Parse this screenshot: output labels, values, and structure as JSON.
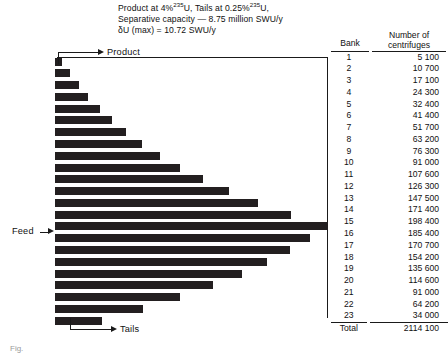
{
  "header": {
    "line1_a": "Product at 4%",
    "line1_sup1": "235",
    "line1_b": "U, Tails at 0.25%",
    "line1_sup2": "235",
    "line1_c": "U,",
    "line2": "Separative capacity — 8.75 million SWU/y",
    "line3": "δU (max)  =  10.72 SWU/y"
  },
  "callouts": {
    "product": "Product",
    "feed": "Feed",
    "tails": "Tails"
  },
  "table": {
    "col_bank": "Bank",
    "col_count_line1": "Number of",
    "col_count_line2": "centrifuges",
    "total_label": "Total",
    "total_value": "2114 100",
    "rows": [
      {
        "bank": "1",
        "count": "5 100"
      },
      {
        "bank": "2",
        "count": "10 700"
      },
      {
        "bank": "3",
        "count": "17 100"
      },
      {
        "bank": "4",
        "count": "24 300"
      },
      {
        "bank": "5",
        "count": "32 400"
      },
      {
        "bank": "6",
        "count": "41 400"
      },
      {
        "bank": "7",
        "count": "51 700"
      },
      {
        "bank": "8",
        "count": "63 200"
      },
      {
        "bank": "9",
        "count": "76 300"
      },
      {
        "bank": "10",
        "count": "91 000"
      },
      {
        "bank": "11",
        "count": "107 600"
      },
      {
        "bank": "12",
        "count": "126 300"
      },
      {
        "bank": "13",
        "count": "147 500"
      },
      {
        "bank": "14",
        "count": "171 400"
      },
      {
        "bank": "15",
        "count": "198 400"
      },
      {
        "bank": "16",
        "count": "185 400"
      },
      {
        "bank": "17",
        "count": "170 700"
      },
      {
        "bank": "18",
        "count": "154 200"
      },
      {
        "bank": "19",
        "count": "135 600"
      },
      {
        "bank": "20",
        "count": "114 600"
      },
      {
        "bank": "21",
        "count": "91 000"
      },
      {
        "bank": "22",
        "count": "64 200"
      },
      {
        "bank": "23",
        "count": "34 000"
      }
    ]
  },
  "caption": "Fig.",
  "colors": {
    "bar": "#231f20",
    "rule": "#1a1a1a",
    "background": "#ffffff"
  },
  "chart_data": {
    "type": "bar",
    "orientation": "horizontal",
    "xlabel": "Number of centrifuges",
    "ylabel": "Bank",
    "categories": [
      "1",
      "2",
      "3",
      "4",
      "5",
      "6",
      "7",
      "8",
      "9",
      "10",
      "11",
      "12",
      "13",
      "14",
      "15",
      "16",
      "17",
      "18",
      "19",
      "20",
      "21",
      "22",
      "23"
    ],
    "values": [
      5100,
      10700,
      17100,
      24300,
      32400,
      41400,
      51700,
      63200,
      76300,
      91000,
      107600,
      126300,
      147500,
      171400,
      198400,
      185400,
      170700,
      154200,
      135600,
      114600,
      91000,
      64200,
      34000
    ],
    "total": 2114100,
    "xlim": [
      0,
      198400
    ],
    "grid": false,
    "legend": false,
    "annotations": [
      {
        "text": "Product",
        "points_to_category": "1"
      },
      {
        "text": "Feed",
        "points_to_category": "15"
      },
      {
        "text": "Tails",
        "points_to_category": "23"
      }
    ]
  }
}
